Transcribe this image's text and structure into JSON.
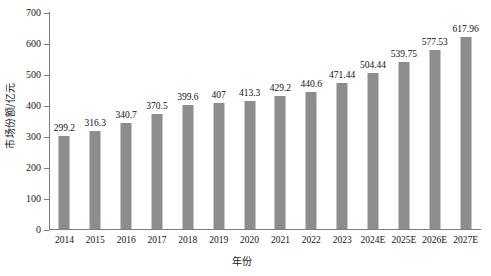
{
  "chart_data": {
    "type": "bar",
    "title": "",
    "subtitle": "",
    "xlabel": "年份",
    "ylabel": "市场份额/亿元",
    "categories": [
      "2014",
      "2015",
      "2016",
      "2017",
      "2018",
      "2019",
      "2020",
      "2021",
      "2022",
      "2023",
      "2024E",
      "2025E",
      "2026E",
      "2027E"
    ],
    "values": [
      299.2,
      316.3,
      340.7,
      370.5,
      399.6,
      407,
      413.3,
      429.2,
      440.6,
      471.44,
      504.44,
      539.75,
      577.53,
      617.96
    ],
    "value_labels": [
      "299.2",
      "316.3",
      "340.7",
      "370.5",
      "399.6",
      "407",
      "413.3",
      "429.2",
      "440.6",
      "471.44",
      "504.44",
      "539.75",
      "577.53",
      "617.96"
    ],
    "ylim": [
      0,
      700
    ],
    "ytick_values": [
      0,
      100,
      200,
      300,
      400,
      500,
      600,
      700
    ],
    "ytick_labels": [
      "0",
      "100",
      "200",
      "300",
      "400",
      "500",
      "600",
      "700"
    ],
    "grid": false,
    "legend": null,
    "legend_position": "none",
    "series": [
      {
        "name": "市场份额",
        "color": "#8d8d8d",
        "values": [
          299.2,
          316.3,
          340.7,
          370.5,
          399.6,
          407,
          413.3,
          429.2,
          440.6,
          471.44,
          504.44,
          539.75,
          577.53,
          617.96
        ]
      }
    ],
    "colors": {
      "bar": "#8d8d8d",
      "axis": "#7d7d7d",
      "text": "#111111",
      "background": "#ffffff"
    }
  }
}
